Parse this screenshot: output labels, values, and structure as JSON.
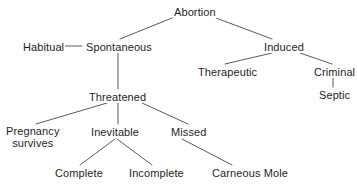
{
  "diagram": {
    "title": "Abortion",
    "type": "tree-classification",
    "colors": {
      "background": "#ffffff",
      "text": "#1e1e1e",
      "edge": "#5a5a5a"
    },
    "nodes": [
      {
        "id": "abortion",
        "label": "Abortion",
        "x": 173,
        "y": 6,
        "lines": [
          "Abortion"
        ]
      },
      {
        "id": "habitual",
        "label": "Habitual",
        "x": 22,
        "y": 41,
        "lines": [
          "Habitual"
        ]
      },
      {
        "id": "spontaneous",
        "label": "Spontaneous",
        "x": 85,
        "y": 41,
        "lines": [
          "Spontaneous"
        ]
      },
      {
        "id": "induced",
        "label": "Induced",
        "x": 263,
        "y": 41,
        "lines": [
          "Induced"
        ]
      },
      {
        "id": "therapeutic",
        "label": "Therapeutic",
        "x": 197,
        "y": 66,
        "lines": [
          "Therapeutic"
        ]
      },
      {
        "id": "criminal",
        "label": "Criminal",
        "x": 313,
        "y": 66,
        "lines": [
          "Criminal"
        ]
      },
      {
        "id": "septic",
        "label": "Septic",
        "x": 318,
        "y": 89,
        "lines": [
          "Septic"
        ]
      },
      {
        "id": "threatened",
        "label": "Threatened",
        "x": 88,
        "y": 91,
        "lines": [
          "Threatened"
        ]
      },
      {
        "id": "pregnancy",
        "label": "Pregnancy survives",
        "x": 5,
        "y": 126,
        "lines": [
          "Pregnancy",
          "survives"
        ]
      },
      {
        "id": "inevitable",
        "label": "Inevitable",
        "x": 90,
        "y": 126,
        "lines": [
          "Inevitable"
        ]
      },
      {
        "id": "missed",
        "label": "Missed",
        "x": 170,
        "y": 126,
        "lines": [
          "Missed"
        ]
      },
      {
        "id": "complete",
        "label": "Complete",
        "x": 54,
        "y": 167,
        "lines": [
          "Complete"
        ]
      },
      {
        "id": "incomplete",
        "label": "Incomplete",
        "x": 128,
        "y": 167,
        "lines": [
          "Incomplete"
        ]
      },
      {
        "id": "carneous_mole",
        "label": "Carneous Mole",
        "x": 211,
        "y": 167,
        "lines": [
          "Carneous Mole"
        ]
      }
    ],
    "edges": [
      {
        "id": "abortion-spontaneous",
        "from": "abortion",
        "to": "spontaneous",
        "x1": 172,
        "y1": 18,
        "x2": 120,
        "y2": 39
      },
      {
        "id": "abortion-induced",
        "from": "abortion",
        "to": "induced",
        "x1": 216,
        "y1": 18,
        "x2": 272,
        "y2": 39
      },
      {
        "id": "habitual-spontaneous",
        "from": "habitual",
        "to": "spontaneous",
        "x1": 62,
        "y1": 46,
        "x2": 82,
        "y2": 46
      },
      {
        "id": "induced-therapeutic",
        "from": "induced",
        "to": "therapeutic",
        "x1": 272,
        "y1": 53,
        "x2": 225,
        "y2": 64
      },
      {
        "id": "induced-criminal",
        "from": "induced",
        "to": "criminal",
        "x1": 300,
        "y1": 53,
        "x2": 332,
        "y2": 64
      },
      {
        "id": "criminal-septic",
        "from": "criminal",
        "to": "septic",
        "x1": 333,
        "y1": 76,
        "x2": 333,
        "y2": 87
      },
      {
        "id": "spontaneous-threatened",
        "from": "spontaneous",
        "to": "threatened",
        "x1": 118,
        "y1": 53,
        "x2": 118,
        "y2": 89
      },
      {
        "id": "threatened-pregnancy",
        "from": "threatened",
        "to": "pregnancy",
        "x1": 107,
        "y1": 103,
        "x2": 36,
        "y2": 124
      },
      {
        "id": "threatened-inevitable",
        "from": "threatened",
        "to": "inevitable",
        "x1": 118,
        "y1": 103,
        "x2": 118,
        "y2": 124
      },
      {
        "id": "threatened-missed",
        "from": "threatened",
        "to": "missed",
        "x1": 142,
        "y1": 103,
        "x2": 188,
        "y2": 124
      },
      {
        "id": "inevitable-complete",
        "from": "inevitable",
        "to": "complete",
        "x1": 115,
        "y1": 139,
        "x2": 80,
        "y2": 165
      },
      {
        "id": "inevitable-incomplete",
        "from": "inevitable",
        "to": "incomplete",
        "x1": 117,
        "y1": 139,
        "x2": 152,
        "y2": 165
      },
      {
        "id": "missed-carneous",
        "from": "missed",
        "to": "carneous_mole",
        "x1": 182,
        "y1": 139,
        "x2": 232,
        "y2": 165
      }
    ]
  }
}
